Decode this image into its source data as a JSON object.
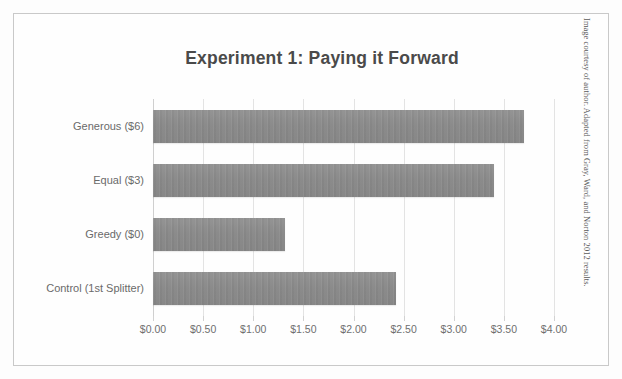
{
  "figure": {
    "source_caption": "Image courtesy of author. Adapted from Gray, Ward, and Norton 2012 results."
  },
  "chart_data": {
    "type": "bar",
    "orientation": "horizontal",
    "title": "Experiment 1: Paying it Forward",
    "xlabel": "",
    "ylabel": "",
    "categories": [
      "Generous ($6)",
      "Equal ($3)",
      "Greedy ($0)",
      "Control (1st Splitter)"
    ],
    "values": [
      3.7,
      3.4,
      1.32,
      2.42
    ],
    "xlim": [
      0,
      4
    ],
    "xticks": [
      0,
      0.5,
      1,
      1.5,
      2,
      2.5,
      3,
      3.5,
      4
    ],
    "xticklabels": [
      "$0.00",
      "$0.50",
      "$1.00",
      "$1.50",
      "$2.00",
      "$2.50",
      "$3.00",
      "$3.50",
      "$4.00"
    ],
    "grid": true,
    "grid_axis": "x",
    "legend": false,
    "bar_color": "#8b8b8b",
    "title_color": "#4a4a4a",
    "tick_color": "#6f6f6f",
    "gridline_color": "#e3e3e3",
    "background_color": "#fefefe",
    "border_color": "#c9c9c9"
  }
}
